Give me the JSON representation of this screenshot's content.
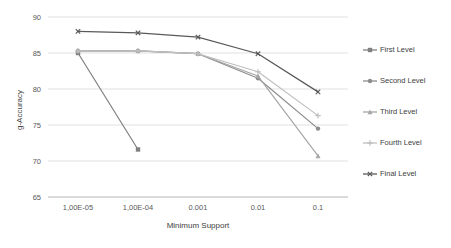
{
  "chart_data": {
    "type": "line",
    "title": "",
    "xlabel": "Minimum Support",
    "ylabel": "g-Accuracy",
    "categories": [
      "1,00E-05",
      "1,00E-04",
      "0.001",
      "0.01",
      "0.1"
    ],
    "ylim": [
      65,
      90
    ],
    "yticks": [
      65,
      70,
      75,
      80,
      85,
      90
    ],
    "ytick_labels": [
      "65",
      "70",
      "75",
      "80",
      "85",
      "90"
    ],
    "grid": "horizontal",
    "legend_position": "right",
    "series": [
      {
        "name": "First Level",
        "color": "#808080",
        "marker": "square",
        "values": [
          85.0,
          71.6,
          null,
          null,
          null
        ]
      },
      {
        "name": "Second Level",
        "color": "#8c8c8c",
        "marker": "circle",
        "values": [
          85.3,
          85.3,
          84.9,
          81.5,
          74.5
        ]
      },
      {
        "name": "Third Level",
        "color": "#a6a6a6",
        "marker": "triangle",
        "values": [
          85.3,
          85.3,
          84.9,
          81.8,
          70.7
        ]
      },
      {
        "name": "Fourth Level",
        "color": "#bfbfbf",
        "marker": "cross",
        "values": [
          85.3,
          85.3,
          84.9,
          82.4,
          76.3
        ]
      },
      {
        "name": "Final Level",
        "color": "#595959",
        "marker": "x",
        "values": [
          88.0,
          87.8,
          87.2,
          84.9,
          79.6
        ]
      }
    ]
  },
  "legend": {
    "items": [
      {
        "label": "First Level"
      },
      {
        "label": "Second Level"
      },
      {
        "label": "Third Level"
      },
      {
        "label": "Fourth Level"
      },
      {
        "label": "Final Level"
      }
    ]
  }
}
